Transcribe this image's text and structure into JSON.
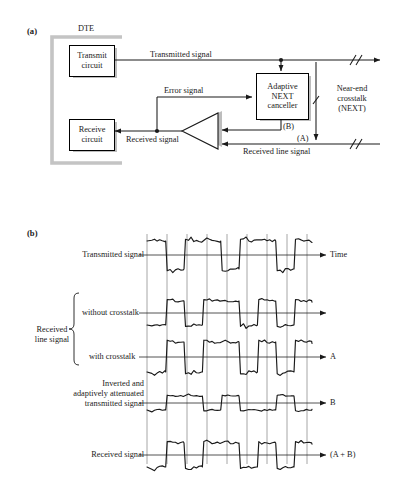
{
  "figure": {
    "panel_a": {
      "tag": "(a)",
      "dte_label": "DTE",
      "blocks": [
        {
          "id": "transmit-circuit",
          "line1": "Transmit",
          "line2": "circuit"
        },
        {
          "id": "receive-circuit",
          "line1": "Receive",
          "line2": "circuit"
        },
        {
          "id": "next-canceller",
          "line1": "Adaptive",
          "line2": "NEXT",
          "line3": "canceller"
        }
      ],
      "labels": {
        "transmitted_signal": "Transmitted signal",
        "error_signal": "Error signal",
        "received_signal": "Received signal",
        "received_line_signal": "Received line signal",
        "near_end_crosstalk": "Near-end\ncrosstalk\n(NEXT)",
        "near_end_line1": "Near-end",
        "near_end_line2": "crosstalk",
        "near_end_line3": "(NEXT)",
        "point_b": "(B)",
        "point_a": "(A)"
      }
    },
    "panel_b": {
      "tag": "(b)",
      "left_labels": {
        "transmitted_signal": "Transmitted signal",
        "received_line_signal_line1": "Received",
        "received_line_signal_line2": "line signal",
        "without_crosstalk": "without crosstalk",
        "with_crosstalk": "with crosstalk",
        "inverted_line1": "Inverted and",
        "inverted_line2": "adaptively attenuated",
        "inverted_line3": "transmitted signal",
        "received_signal": "Received signal"
      },
      "right_labels": {
        "trace1": "Time",
        "trace2": "",
        "trace3": "A",
        "trace4": "B",
        "trace5": "(A + B)"
      }
    }
  },
  "chart_data": {
    "type": "line",
    "xlabel": "Time",
    "ylabel": "",
    "grid": true,
    "axis_x_range": [
      147,
      312
    ],
    "gridlines_x": [
      147,
      167,
      187,
      207,
      227,
      247,
      267,
      287,
      307
    ],
    "series": [
      {
        "name": "Transmitted signal",
        "right_label": "Time",
        "baseline_y": 255,
        "amplitude": 14,
        "bits": [
          1,
          0,
          1,
          1,
          0,
          1,
          1,
          0,
          1
        ]
      },
      {
        "name": "Received line signal without crosstalk",
        "right_label": "",
        "baseline_y": 313,
        "amplitude": 12,
        "bits": [
          0,
          1,
          0,
          1,
          1,
          0,
          1,
          0,
          1
        ]
      },
      {
        "name": "Received line signal with crosstalk",
        "right_label": "A",
        "baseline_y": 357,
        "amplitude": 15,
        "bits": [
          0,
          1,
          0,
          1,
          1,
          0,
          1,
          0,
          1
        ]
      },
      {
        "name": "Inverted and adaptively attenuated transmitted signal",
        "right_label": "B",
        "baseline_y": 403,
        "amplitude": 7,
        "bits": [
          0,
          1,
          1,
          0,
          1,
          0,
          0,
          1,
          0
        ]
      },
      {
        "name": "Received signal",
        "right_label": "(A + B)",
        "baseline_y": 455,
        "amplitude": 12,
        "bits": [
          0,
          1,
          0,
          1,
          1,
          0,
          1,
          0,
          1
        ]
      }
    ]
  },
  "colors": {
    "ink": "#1a1a1a",
    "shadow": "#bdbdbd",
    "grid": "#777777",
    "dte_bracket": "#c4c4c4"
  }
}
